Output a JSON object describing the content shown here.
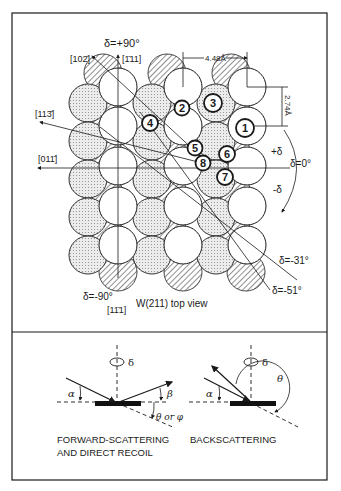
{
  "figure": {
    "top_panel": {
      "title": "W(211) top view",
      "axis_labels": {
        "delta_plus_90": "δ=+90°",
        "delta_minus_90": "δ=-90°",
        "delta_zero": "δ=0°",
        "delta_minus_31": "δ=-31°",
        "delta_minus_51": "δ=-51°",
        "plus_delta": "+δ",
        "minus_delta": "-δ"
      },
      "directions": {
        "d_102": "[102̄]",
        "d_111_up": "[1̄11]",
        "d_113": "[113̄]",
        "d_011": "[011̄]",
        "d_111_down": "[11̄1]"
      },
      "dimensions": {
        "horizontal": "4.48Å",
        "vertical": "2.74Å"
      },
      "atom_markers": [
        "1",
        "2",
        "3",
        "4",
        "5",
        "6",
        "7",
        "8"
      ]
    },
    "bottom_panel": {
      "forward": {
        "caption_line1": "FORWARD-SCATTERING",
        "caption_line2": "AND DIRECT RECOIL",
        "alpha": "α",
        "beta": "β",
        "theta_or_phi": "θ or φ",
        "delta": "δ"
      },
      "back": {
        "caption": "BACKSCATTERING",
        "alpha": "α",
        "theta": "θ",
        "delta": "δ"
      }
    },
    "colors": {
      "ink": "#1a1a1a",
      "paper": "#ffffff",
      "dotted_fill": "#d9d9d9",
      "hatch": "#333333"
    }
  }
}
